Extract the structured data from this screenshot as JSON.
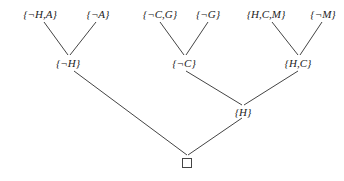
{
  "diagram": {
    "type": "resolution-refutation-tree",
    "leaves": [
      {
        "label": "{¬H,A}"
      },
      {
        "label": "{¬A}"
      },
      {
        "label": "{¬C,G}"
      },
      {
        "label": "{¬G}"
      },
      {
        "label": "{H,C,M}"
      },
      {
        "label": "{¬M}"
      }
    ],
    "level2": [
      {
        "label": "{¬H}"
      },
      {
        "label": "{¬C}"
      },
      {
        "label": "{H,C}"
      }
    ],
    "level3": [
      {
        "label": "{H}"
      }
    ],
    "root": {
      "label": "□",
      "meaning": "empty clause"
    },
    "edges": [
      [
        "{¬H,A}",
        "{¬H}"
      ],
      [
        "{¬A}",
        "{¬H}"
      ],
      [
        "{¬C,G}",
        "{¬C}"
      ],
      [
        "{¬G}",
        "{¬C}"
      ],
      [
        "{H,C,M}",
        "{H,C}"
      ],
      [
        "{¬M}",
        "{H,C}"
      ],
      [
        "{¬C}",
        "{H}"
      ],
      [
        "{H,C}",
        "{H}"
      ],
      [
        "{¬H}",
        "□"
      ],
      [
        "{H}",
        "□"
      ]
    ],
    "colors": {
      "line": "#444444",
      "text": "#222222",
      "background": "#ffffff"
    }
  }
}
